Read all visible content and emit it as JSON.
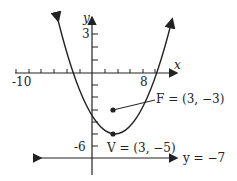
{
  "diagram": {
    "type": "parabola-graph",
    "equation_hint": "vertex (3,-5), focus (3,-3), directrix y=-7",
    "axes": {
      "x_label": "x",
      "y_label": "y",
      "x_tick_labels": [
        "-10",
        "8"
      ],
      "y_tick_labels": [
        "3",
        "-6"
      ]
    },
    "focus": {
      "label": "F = (3, −3)",
      "x": 3,
      "y": -3
    },
    "vertex": {
      "label": "V = (3, −5)",
      "x": 3,
      "y": -5
    },
    "directrix": {
      "label": "y = −7",
      "y": -7
    }
  }
}
